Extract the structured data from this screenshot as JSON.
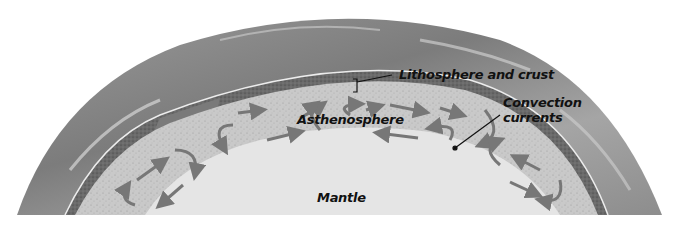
{
  "diagram": {
    "labels": {
      "lithosphere": "Lithosphere and crust",
      "convection_line1": "Convection",
      "convection_line2": "currents",
      "asthenosphere": "Asthenosphere",
      "mantle": "Mantle"
    },
    "layers": [
      {
        "name": "Outer surface / atmosphere",
        "color": "#8a8a8a"
      },
      {
        "name": "Lithosphere and crust",
        "color": "#6e6e6e"
      },
      {
        "name": "Asthenosphere",
        "color": "#c8c8c8"
      },
      {
        "name": "Mantle",
        "color": "#e6e6e6"
      }
    ],
    "arrow_color": "#777777"
  }
}
